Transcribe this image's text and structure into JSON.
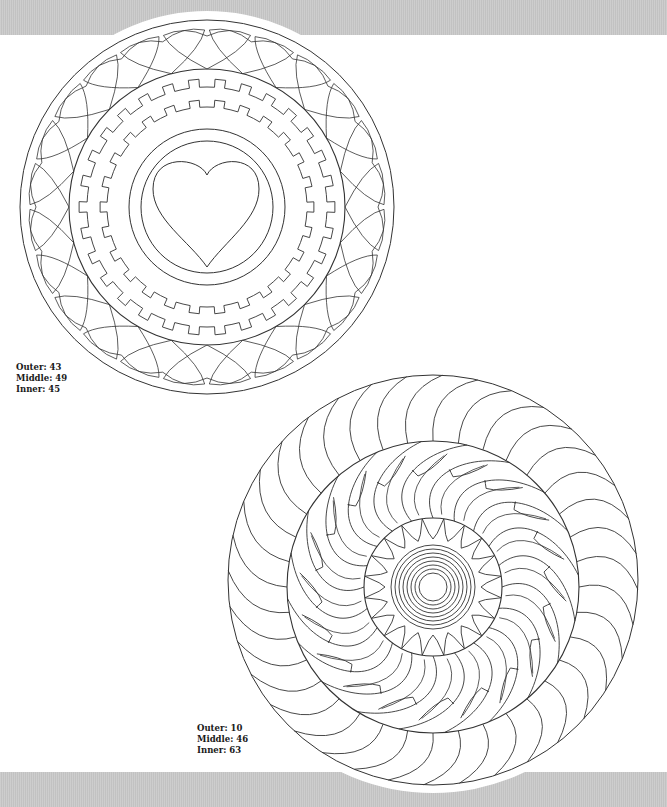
{
  "page": {
    "background": "#ffffff",
    "band_color": "#c8c8c8",
    "line_color": "#333333"
  },
  "mandala_top": {
    "center": [
      207,
      207
    ],
    "outer_radius": 187,
    "halo_radius": 196,
    "heart_count": 24,
    "middle_radius": 138,
    "gear_outer_radius": 120,
    "gear_outer_teeth": 30,
    "gear_inner_radius": 100,
    "gear_inner_teeth": 26,
    "inner_circles": [
      78,
      66
    ],
    "center_motif": "heart",
    "labels": [
      {
        "key": "Outer",
        "value": "43"
      },
      {
        "key": "Middle",
        "value": "49"
      },
      {
        "key": "Inner",
        "value": "45"
      }
    ]
  },
  "mandala_bottom": {
    "center": [
      433,
      580
    ],
    "outer_radius": 205,
    "halo_radius": 213,
    "outer_segments": 36,
    "middle_center": [
      433,
      587
    ],
    "middle_radius": 146,
    "feather_count": 20,
    "inner_center": [
      433,
      587
    ],
    "inner_radius": 69,
    "teeth": 20,
    "rings": [
      14,
      18,
      22,
      26,
      30,
      34,
      38,
      42
    ],
    "labels": [
      {
        "key": "Outer",
        "value": "10"
      },
      {
        "key": "Middle",
        "value": "46"
      },
      {
        "key": "Inner",
        "value": "63"
      }
    ]
  }
}
